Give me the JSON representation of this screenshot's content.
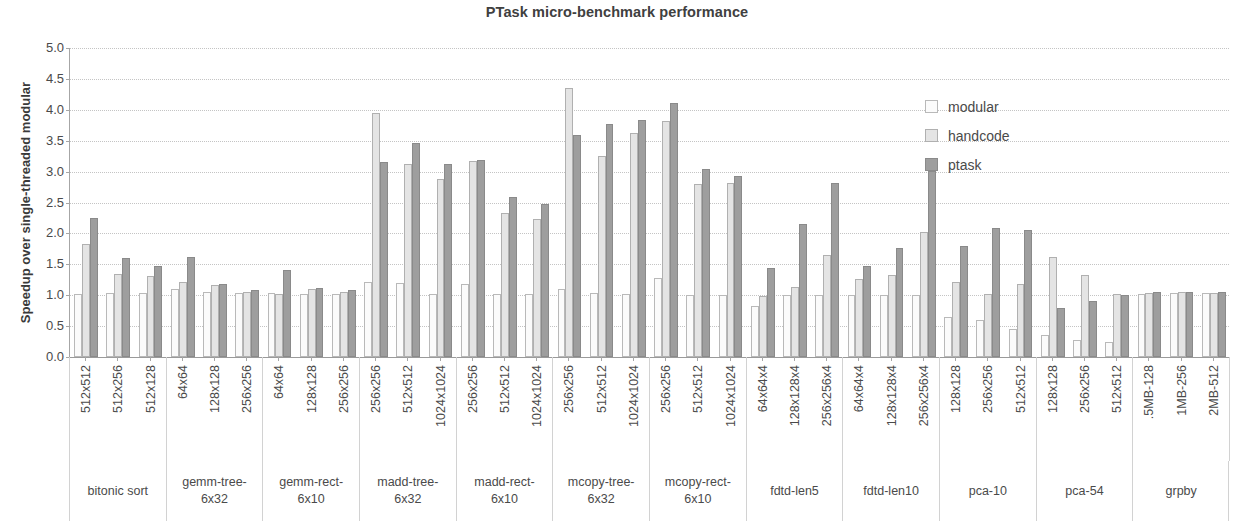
{
  "chart_data": {
    "type": "bar",
    "title": "PTask micro-benchmark performance",
    "xlabel": "",
    "ylabel": "Speedup over single-threaded modular",
    "ylim": [
      0,
      5
    ],
    "ytick_step": 0.5,
    "ytick_labels": [
      "0.0",
      "0.5",
      "1.0",
      "1.5",
      "2.0",
      "2.5",
      "3.0",
      "3.5",
      "4.0",
      "4.5",
      "5.0"
    ],
    "grid": true,
    "legend_position": "upper-right",
    "colors": {
      "modular": "#fbfbfb",
      "handcode": "#e4e4e4",
      "ptask": "#9e9e9e"
    },
    "series": [
      {
        "name": "modular",
        "values": [
          1.02,
          1.03,
          1.03,
          1.1,
          1.05,
          1.04,
          1.03,
          1.02,
          1.02,
          1.22,
          1.2,
          1.02,
          1.18,
          1.02,
          1.02,
          1.1,
          1.03,
          1.02,
          1.28,
          1.0,
          1.0,
          0.82,
          1.0,
          1.0,
          1.0,
          1.0,
          1.0,
          0.65,
          0.6,
          0.45,
          0.35,
          0.28,
          0.24,
          1.02,
          1.03,
          1.03
        ]
      },
      {
        "name": "handcode",
        "values": [
          1.83,
          1.35,
          1.31,
          1.22,
          1.17,
          1.06,
          1.02,
          1.1,
          1.05,
          3.95,
          3.13,
          2.88,
          3.17,
          2.33,
          2.24,
          4.35,
          3.25,
          3.62,
          3.82,
          2.8,
          2.82,
          0.98,
          1.13,
          1.65,
          1.26,
          1.32,
          2.02,
          1.22,
          1.02,
          1.18,
          1.62,
          1.32,
          1.02,
          1.04,
          1.05,
          1.04
        ]
      },
      {
        "name": "ptask",
        "values": [
          2.25,
          1.6,
          1.48,
          1.62,
          1.18,
          1.08,
          1.41,
          1.12,
          1.08,
          3.16,
          3.47,
          3.12,
          3.19,
          2.59,
          2.48,
          3.6,
          3.77,
          3.84,
          4.11,
          3.04,
          2.93,
          1.44,
          2.15,
          2.82,
          1.48,
          1.77,
          3.01,
          1.8,
          2.08,
          2.05,
          0.8,
          0.9,
          1.0,
          1.05,
          1.05,
          1.06
        ]
      }
    ],
    "groups": [
      {
        "label": "bitonic sort",
        "categories": [
          "512x512",
          "512x256",
          "512x128"
        ]
      },
      {
        "label": "gemm-tree-\n6x32",
        "categories": [
          "64x64",
          "128x128",
          "256x256"
        ]
      },
      {
        "label": "gemm-rect-\n6x10",
        "categories": [
          "64x64",
          "128x128",
          "256x256"
        ]
      },
      {
        "label": "madd-tree-\n6x32",
        "categories": [
          "256x256",
          "512x512",
          "1024x1024"
        ]
      },
      {
        "label": "madd-rect-\n6x10",
        "categories": [
          "256x256",
          "512x512",
          "1024x1024"
        ]
      },
      {
        "label": "mcopy-tree-\n6x32",
        "categories": [
          "256x256",
          "512x512",
          "1024x1024"
        ]
      },
      {
        "label": "mcopy-rect-\n6x10",
        "categories": [
          "256x256",
          "512x512",
          "1024x1024"
        ]
      },
      {
        "label": "fdtd-len5",
        "categories": [
          "64x64x4",
          "128x128x4",
          "256x256x4"
        ]
      },
      {
        "label": "fdtd-len10",
        "categories": [
          "64x64x4",
          "128x128x4",
          "256x256x4"
        ]
      },
      {
        "label": "pca-10",
        "categories": [
          "128x128",
          "256x256",
          "512x512"
        ]
      },
      {
        "label": "pca-54",
        "categories": [
          "128x128",
          "256x256",
          "512x512"
        ]
      },
      {
        "label": "grpby",
        "categories": [
          ".5MB-128",
          "1MB-256",
          "2MB-512"
        ]
      }
    ]
  },
  "legend": {
    "items": [
      {
        "key": "modular",
        "label": "modular"
      },
      {
        "key": "handcode",
        "label": "handcode"
      },
      {
        "key": "ptask",
        "label": "ptask"
      }
    ]
  }
}
